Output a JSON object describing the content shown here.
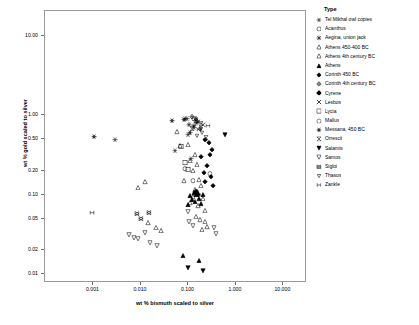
{
  "chart_data": {
    "type": "scatter",
    "title": "",
    "xlabel": "wt % bismuth scaled to silver",
    "ylabel": "wt % gold scaled to silver",
    "xscale": "log",
    "yscale": "log",
    "xlim": [
      0.0001,
      30
    ],
    "ylim": [
      0.008,
      20
    ],
    "xticks": [
      0.001,
      0.01,
      0.1,
      1.0,
      10.0
    ],
    "xticklabels": [
      "0.001",
      "0.010",
      "0.100",
      "1.000",
      "10.000"
    ],
    "yticks": [
      0.01,
      0.02,
      0.05,
      0.1,
      0.2,
      0.5,
      1.0,
      10.0
    ],
    "yticklabels": [
      "0.01",
      "0.02",
      "0.05",
      "0.10",
      "0.20",
      "0.50",
      "1.00",
      "10.00"
    ],
    "grid": false,
    "legend_position": "right",
    "legend_title": "Type",
    "series": [
      {
        "name": "Tel Mikhal owl copies",
        "marker": "asterisk6",
        "filled": false,
        "points": [
          [
            0.003,
            0.52
          ],
          [
            0.055,
            0.37
          ],
          [
            0.09,
            0.95
          ],
          [
            0.1,
            0.93
          ],
          [
            0.12,
            0.3
          ],
          [
            0.105,
            0.6
          ],
          [
            0.14,
            0.72
          ]
        ]
      },
      {
        "name": "Acanthus",
        "marker": "circle",
        "filled": false,
        "points": [
          [
            0.088,
            0.22
          ],
          [
            0.3,
            0.19
          ],
          [
            0.13,
            0.155
          ]
        ]
      },
      {
        "name": "Aegina, union jack",
        "marker": "asterisk8",
        "filled": false,
        "points": [
          [
            0.11,
            0.8
          ],
          [
            0.135,
            0.76
          ],
          [
            0.15,
            0.9
          ],
          [
            0.16,
            0.83
          ]
        ]
      },
      {
        "name": "Athens 450-400 BC",
        "marker": "triangle-up",
        "filled": false,
        "points": [
          [
            0.06,
            0.64
          ],
          [
            0.07,
            0.43
          ],
          [
            0.105,
            0.45
          ],
          [
            0.115,
            0.28
          ],
          [
            0.13,
            0.21
          ],
          [
            0.145,
            0.33
          ],
          [
            0.16,
            0.25
          ],
          [
            0.085,
            0.155
          ],
          [
            0.175,
            0.16
          ],
          [
            0.19,
            0.135
          ],
          [
            0.145,
            0.12
          ],
          [
            0.13,
            0.098
          ],
          [
            0.115,
            0.082
          ],
          [
            0.17,
            0.075
          ],
          [
            0.21,
            0.093
          ],
          [
            0.23,
            0.066
          ]
        ]
      },
      {
        "name": "Athens 4th century BC",
        "marker": "triangle-up",
        "filled": false,
        "points": [
          [
            0.009,
            0.128
          ],
          [
            0.013,
            0.15
          ],
          [
            0.015,
            0.046
          ],
          [
            0.022,
            0.04
          ],
          [
            0.028,
            0.037
          ],
          [
            0.155,
            0.055
          ],
          [
            0.185,
            0.05
          ],
          [
            0.23,
            0.048
          ],
          [
            0.2,
            0.038
          ],
          [
            0.26,
            0.041
          ]
        ]
      },
      {
        "name": "Athens",
        "marker": "triangle-up",
        "filled": true,
        "points": [
          [
            0.115,
            0.1
          ],
          [
            0.135,
            0.11
          ],
          [
            0.15,
            0.105
          ],
          [
            0.16,
            0.115
          ],
          [
            0.125,
            0.09
          ],
          [
            0.145,
            0.086
          ],
          [
            0.175,
            0.092
          ],
          [
            0.105,
            0.078
          ],
          [
            0.19,
            0.08
          ],
          [
            0.21,
            0.105
          ],
          [
            0.08,
            0.018
          ],
          [
            0.175,
            0.0155
          ]
        ]
      },
      {
        "name": "Corinth 450 BC",
        "marker": "diamond",
        "filled": true,
        "points": [
          [
            0.23,
            0.52
          ],
          [
            0.28,
            0.47
          ],
          [
            0.3,
            0.33
          ],
          [
            0.33,
            0.38
          ],
          [
            0.26,
            0.24
          ],
          [
            0.31,
            0.175
          ],
          [
            0.35,
            0.135
          ],
          [
            0.24,
            0.15
          ],
          [
            0.22,
            0.195
          ],
          [
            0.195,
            0.31
          ]
        ]
      },
      {
        "name": "Corinth 4th century BC",
        "marker": "diamond-cross",
        "filled": false,
        "points": [
          [
            0.125,
            1.0
          ],
          [
            0.15,
            0.93
          ],
          [
            0.18,
            0.7
          ]
        ]
      },
      {
        "name": "Cyrene",
        "marker": "plus-filled",
        "filled": true,
        "points": [
          [
            0.155,
            0.115
          ],
          [
            0.17,
            0.105
          ]
        ]
      },
      {
        "name": "Lesbos",
        "marker": "x",
        "filled": false,
        "points": [
          [
            0.165,
            0.86
          ],
          [
            0.215,
            0.8
          ]
        ]
      },
      {
        "name": "Lycia",
        "marker": "square",
        "filled": false,
        "points": [
          [
            0.075,
            0.42
          ],
          [
            0.09,
            0.26
          ],
          [
            0.105,
            0.215
          ]
        ]
      },
      {
        "name": "Mallus",
        "marker": "pentagon",
        "filled": false,
        "points": [
          [
            0.14,
            0.95
          ],
          [
            0.155,
            0.88
          ]
        ]
      },
      {
        "name": "Messana, 450 BC",
        "marker": "hexagram",
        "filled": false,
        "points": [
          [
            0.0011,
            0.56
          ],
          [
            0.048,
            0.88
          ],
          [
            0.085,
            0.91
          ],
          [
            0.115,
            0.62
          ]
        ]
      },
      {
        "name": "Orrescii",
        "marker": "hourglass",
        "filled": false,
        "points": [
          [
            0.195,
            0.82
          ],
          [
            0.125,
            0.71
          ],
          [
            0.25,
            0.54
          ]
        ]
      },
      {
        "name": "Salamis",
        "marker": "triangle-down",
        "filled": true,
        "points": [
          [
            0.62,
            0.6
          ],
          [
            0.105,
            0.0125
          ],
          [
            0.215,
            0.0115
          ]
        ]
      },
      {
        "name": "Samos",
        "marker": "triangle-down",
        "filled": false,
        "points": [
          [
            0.006,
            0.0325
          ],
          [
            0.0075,
            0.03
          ],
          [
            0.009,
            0.029
          ],
          [
            0.0125,
            0.035
          ],
          [
            0.016,
            0.026
          ],
          [
            0.023,
            0.024
          ],
          [
            0.11,
            0.047
          ],
          [
            0.13,
            0.043
          ],
          [
            0.36,
            0.04
          ],
          [
            0.4,
            0.0335
          ],
          [
            0.105,
            0.064
          ]
        ]
      },
      {
        "name": "Sigloi",
        "marker": "bowtie",
        "filled": false,
        "points": [
          [
            0.0085,
            0.06
          ],
          [
            0.0105,
            0.052
          ],
          [
            0.0155,
            0.062
          ]
        ]
      },
      {
        "name": "Thasos",
        "marker": "triangle-down-small",
        "filled": false,
        "points": [
          [
            0.19,
            0.7
          ],
          [
            0.205,
            0.62
          ],
          [
            0.16,
            0.58
          ]
        ]
      },
      {
        "name": "Zankle",
        "marker": "i-beam",
        "filled": false,
        "points": [
          [
            0.001,
            0.062
          ],
          [
            0.175,
            0.68
          ],
          [
            0.265,
            0.77
          ]
        ]
      }
    ],
    "extra_points": [
      [
        0.001,
        0.062
      ]
    ]
  }
}
